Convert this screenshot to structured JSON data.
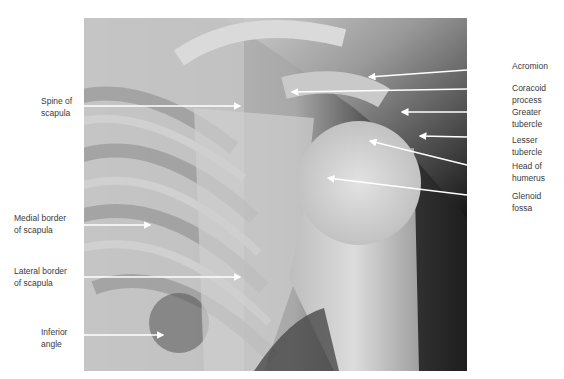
{
  "figure": {
    "type": "radiograph",
    "labels_left": [
      {
        "id": "spine-of-scapula",
        "text": "Spine of\nscapula"
      },
      {
        "id": "medial-border",
        "text": "Medial border\nof scapula"
      },
      {
        "id": "lateral-border",
        "text": "Lateral border\nof scapula"
      },
      {
        "id": "inferior-angle",
        "text": "Inferior\nangle"
      }
    ],
    "labels_right": [
      {
        "id": "acromion",
        "text": "Acromion"
      },
      {
        "id": "coracoid-process",
        "text": "Coracoid\nprocess"
      },
      {
        "id": "greater-tubercle",
        "text": "Greater\ntubercle"
      },
      {
        "id": "lesser-tubercle",
        "text": "Lesser\ntubercle"
      },
      {
        "id": "head-of-humerus",
        "text": "Head of\nhumerus"
      },
      {
        "id": "glenoid-fossa",
        "text": "Glenoid\nfossa"
      }
    ]
  }
}
